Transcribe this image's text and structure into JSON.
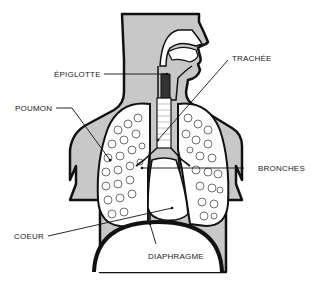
{
  "colors": {
    "body_fill": "#c8c8c8",
    "outline": "#111111",
    "background": "#ffffff",
    "lung_fill": "#ffffff"
  },
  "labels": {
    "epiglotte": "ÉPIGLOTTE",
    "trachee": "TRACHÉE",
    "poumon": "POUMON",
    "bronches": "BRONCHES",
    "coeur": "COEUR",
    "diaphragme": "DIAPHRAGME"
  }
}
